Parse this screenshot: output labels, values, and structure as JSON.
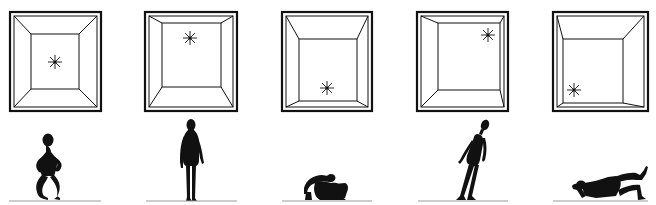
{
  "diagram": {
    "colors": {
      "ink": "#111111",
      "background": "#ffffff",
      "ground": "#9a9a9a"
    },
    "panels": [
      {
        "id": 1,
        "room": {
          "outer": [
            10,
            12,
            101,
            111
          ],
          "inner": [
            31,
            34,
            79,
            89
          ]
        },
        "light": {
          "x": 55,
          "y": 62,
          "position": "center"
        },
        "figure": {
          "posture": "crouching-hands-on-hips"
        },
        "ground": [
          9,
          101
        ]
      },
      {
        "id": 2,
        "room": {
          "outer": [
            145,
            12,
            237,
            111
          ],
          "inner": [
            162,
            23,
            221,
            87
          ]
        },
        "light": {
          "x": 190,
          "y": 38,
          "position": "top"
        },
        "figure": {
          "posture": "standing-upright"
        },
        "ground": [
          146,
          237
        ]
      },
      {
        "id": 3,
        "room": {
          "outer": [
            282,
            12,
            372,
            111
          ],
          "inner": [
            299,
            39,
            357,
            101
          ]
        },
        "light": {
          "x": 327,
          "y": 88,
          "position": "bottom"
        },
        "figure": {
          "posture": "sitting-hunched"
        },
        "ground": [
          282,
          372
        ]
      },
      {
        "id": 4,
        "room": {
          "outer": [
            417,
            12,
            508,
            111
          ],
          "inner": [
            438,
            23,
            500,
            90
          ]
        },
        "light": {
          "x": 488,
          "y": 35,
          "position": "top-right"
        },
        "figure": {
          "posture": "leaning-tilted"
        },
        "ground": [
          418,
          508
        ]
      },
      {
        "id": 5,
        "room": {
          "outer": [
            553,
            12,
            648,
            111
          ],
          "inner": [
            563,
            39,
            623,
            103
          ]
        },
        "light": {
          "x": 574,
          "y": 90,
          "position": "bottom-left"
        },
        "figure": {
          "posture": "lying-reclined"
        },
        "ground": [
          553,
          648
        ]
      }
    ]
  }
}
